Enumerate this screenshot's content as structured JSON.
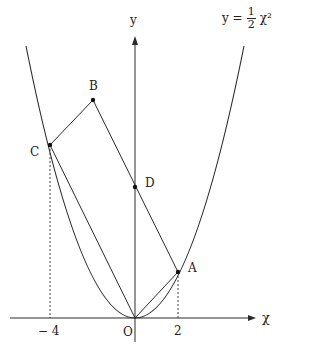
{
  "equation": {
    "lhs": "y =",
    "numerator": "1",
    "denominator": "2",
    "rhs": "χ²"
  },
  "axes": {
    "x_label": "χ",
    "y_label": "y",
    "origin_label": "O"
  },
  "ticks": {
    "neg4": "− 4",
    "pos2": "2"
  },
  "points": {
    "A": {
      "label": "A",
      "coord": [
        2,
        2
      ]
    },
    "B": {
      "label": "B"
    },
    "C": {
      "label": "C",
      "coord": [
        -4,
        8
      ]
    },
    "D": {
      "label": "D"
    },
    "O": {
      "label": "O",
      "coord": [
        0,
        0
      ]
    }
  },
  "colors": {
    "line": "#2a2a2a",
    "background": "#ffffff"
  }
}
